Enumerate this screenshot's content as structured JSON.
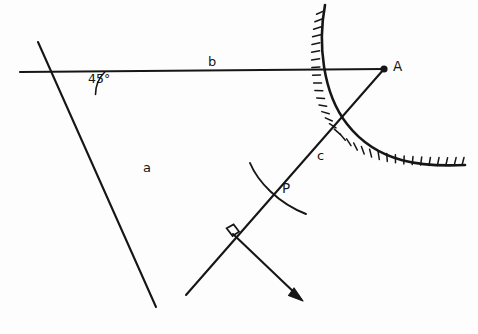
{
  "figure": {
    "kind": "geometry-construction-diagram",
    "background_color": "#fdfdfd",
    "ink_color": "#161616",
    "width": 478,
    "height": 334
  },
  "labels": {
    "angle": "45°",
    "line_a": "a",
    "line_b": "b",
    "line_c": "c",
    "point_a": "A",
    "point_p": "P"
  },
  "geometry": {
    "angle_value_degrees": 45,
    "vertex": {
      "x": 73,
      "y": 73
    },
    "point_a": {
      "x": 384,
      "y": 69
    },
    "point_p": {
      "x": 272,
      "y": 186
    },
    "right_angle_intersection": {
      "x": 233,
      "y": 234
    },
    "arrow_tip": {
      "x": 303,
      "y": 301
    },
    "line_b_start": {
      "x": 20,
      "y": 72
    },
    "line_a_start": {
      "x": 38,
      "y": 42
    },
    "line_a_end": {
      "x": 156,
      "y": 307
    },
    "hatched_curve_start": {
      "x": 325,
      "y": 5
    },
    "hatched_curve_end": {
      "x": 465,
      "y": 165
    }
  },
  "elements": {
    "line_a_name": "line-a-transversal",
    "line_b_name": "line-b-horizontal",
    "line_c_name": "line-c-to-point-a",
    "arrow_ray_name": "perpendicular-ray-with-arrow",
    "hatched_curve_name": "hatched-boundary-curve",
    "arc_name": "construction-arc-through-p",
    "right_angle_marker_name": "right-angle-marker",
    "angle_arc_name": "angle-arc-45"
  }
}
